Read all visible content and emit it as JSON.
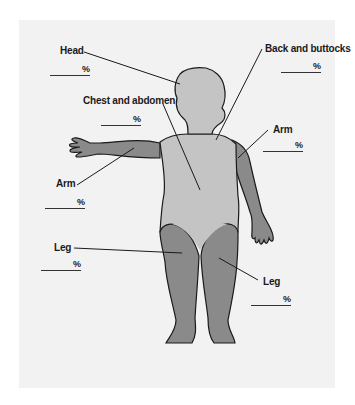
{
  "diagram": {
    "type": "body-surface-area-chart",
    "figure": "child front view",
    "colors": {
      "background": "#ffffff",
      "panel": "#f2f2f2",
      "body_light": "#c4c4c4",
      "body_dark": "#8a8a8a",
      "outline": "#1a1a1a",
      "leader_line": "#1a1a1a"
    },
    "regions": [
      {
        "id": "head",
        "label": "Head",
        "unit": "%"
      },
      {
        "id": "chest-abdomen",
        "label": "Chest and abdomen",
        "unit": "%"
      },
      {
        "id": "back-buttocks",
        "label": "Back and buttocks",
        "unit": "%"
      },
      {
        "id": "arm-left",
        "label": "Arm",
        "unit": "%"
      },
      {
        "id": "arm-right",
        "label": "Arm",
        "unit": "%"
      },
      {
        "id": "leg-left",
        "label": "Leg",
        "unit": "%"
      },
      {
        "id": "leg-right",
        "label": "Leg",
        "unit": "%"
      }
    ]
  }
}
